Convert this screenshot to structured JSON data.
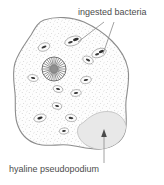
{
  "figure": {
    "background_color": "#ffffff"
  },
  "labels": {
    "ingested_bacteria": "ingested bacteria",
    "hyaline_pseudopodium": "hyaline pseudopodium",
    "text_color": "#4c4c4c"
  },
  "diagram": {
    "cell": {
      "name": "amoeba-cell-body",
      "outline_color": "#8c8c8c",
      "fill_color": "#fcfcfc",
      "stipple_color": "#9a9a9a"
    },
    "nucleus": {
      "name": "nucleus",
      "center_x": 54,
      "center_y": 69,
      "radius": 12,
      "spoke_count": 30,
      "core_radius": 4,
      "outline_color": "#6b6b6b",
      "core_color": "#888888"
    },
    "hyaline_pseudopodium": {
      "name": "hyaline-pseudopodium-lobe",
      "fill_color": "#e8e8e8",
      "edge_color": "#b0b0b0"
    },
    "food_vacuoles": [
      {
        "cx": 44,
        "cy": 47,
        "rx": 6.0,
        "ry": 4.0,
        "rot": -20,
        "bacteria": 1
      },
      {
        "cx": 73,
        "cy": 41,
        "rx": 8.5,
        "ry": 4.5,
        "rot": -18,
        "bacteria": 2
      },
      {
        "cx": 88,
        "cy": 60,
        "rx": 5.5,
        "ry": 3.6,
        "rot": 25,
        "bacteria": 1
      },
      {
        "cx": 99,
        "cy": 53,
        "rx": 7.5,
        "ry": 4.2,
        "rot": -22,
        "bacteria": 2
      },
      {
        "cx": 33,
        "cy": 78,
        "rx": 5.2,
        "ry": 3.4,
        "rot": 10,
        "bacteria": 1
      },
      {
        "cx": 86,
        "cy": 80,
        "rx": 5.4,
        "ry": 3.6,
        "rot": -10,
        "bacteria": 1
      },
      {
        "cx": 58,
        "cy": 89,
        "rx": 5.0,
        "ry": 3.3,
        "rot": 15,
        "bacteria": 1
      },
      {
        "cx": 76,
        "cy": 93,
        "rx": 5.2,
        "ry": 3.4,
        "rot": -8,
        "bacteria": 1
      },
      {
        "cx": 57,
        "cy": 106,
        "rx": 4.8,
        "ry": 3.2,
        "rot": 12,
        "bacteria": 1
      },
      {
        "cx": 40,
        "cy": 118,
        "rx": 6.2,
        "ry": 3.8,
        "rot": -14,
        "bacteria": 1
      },
      {
        "cx": 71,
        "cy": 118,
        "rx": 5.6,
        "ry": 3.6,
        "rot": 8,
        "bacteria": 1
      },
      {
        "cx": 64,
        "cy": 131,
        "rx": 4.6,
        "ry": 3.0,
        "rot": -6,
        "bacteria": 1
      }
    ],
    "leader_lines": {
      "ingested_bacteria": [
        {
          "x1": 104,
          "y1": 22,
          "x2": 78,
          "y2": 42
        },
        {
          "x1": 114,
          "y1": 22,
          "x2": 103,
          "y2": 54
        }
      ],
      "hyaline_pseudopodium": {
        "x1": 104,
        "y1": 163,
        "x2": 104,
        "y2": 133,
        "arrow": "up"
      },
      "color": "#8a8a8a"
    }
  }
}
